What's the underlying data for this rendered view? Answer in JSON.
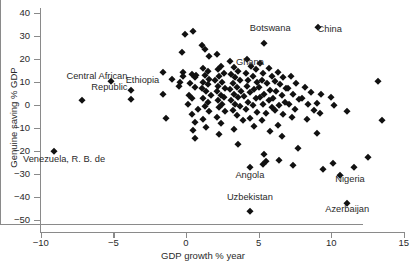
{
  "chart_data": {
    "type": "scatter",
    "title": "",
    "xlabel": "GDP growth % year",
    "ylabel": "Genuine saving % GDP",
    "xlim": [
      -10,
      15
    ],
    "ylim": [
      -50,
      40
    ],
    "xticks": [
      -10,
      -5,
      0,
      5,
      10,
      15
    ],
    "xticklabels": [
      "−10",
      "−5",
      "0",
      "5",
      "10",
      "15"
    ],
    "yticks": [
      40,
      30,
      20,
      10,
      0,
      -10,
      -20,
      -30,
      -40,
      -50
    ],
    "yticklabels": [
      "40",
      "30",
      "20",
      "10",
      "0",
      "−10",
      "−20",
      "−30",
      "−40",
      "−50"
    ],
    "grid": false,
    "legend": null,
    "reference_lines": [
      {
        "axis": "x",
        "value": 0
      },
      {
        "axis": "y",
        "value": 0
      }
    ],
    "marker": "diamond",
    "marker_color": "#111111",
    "annotations": [
      {
        "label": "Central African Republic",
        "x": -7.2,
        "y": 12.0,
        "point_x": -7.2,
        "point_y": 2.0
      },
      {
        "label": "Ethiopia",
        "x": -3.0,
        "y": 10.5,
        "point_x": -3.8,
        "point_y": 6.5
      },
      {
        "label": "Botswana",
        "x": 5.8,
        "y": 33.0,
        "point_x": 5.4,
        "point_y": 27.0
      },
      {
        "label": "Ghana",
        "x": 4.4,
        "y": 18.5,
        "point_x": 4.5,
        "point_y": 17.0
      },
      {
        "label": "China",
        "x": 9.9,
        "y": 32.5,
        "point_x": 9.1,
        "point_y": 34.0
      },
      {
        "label": "Venezuela, R. B. de",
        "x": -8.4,
        "y": -24.0,
        "point_x": -9.1,
        "point_y": -20.0
      },
      {
        "label": "Angola",
        "x": 4.4,
        "y": -31.0,
        "point_x": 4.4,
        "point_y": -27.0
      },
      {
        "label": "Nigeria",
        "x": 11.3,
        "y": -32.5,
        "point_x": 10.6,
        "point_y": -30.5
      },
      {
        "label": "Uzbekistan",
        "x": 4.4,
        "y": -40.5,
        "point_x": 4.4,
        "point_y": -46.0
      },
      {
        "label": "Azerbaijan",
        "x": 11.1,
        "y": -45.5,
        "point_x": 11.1,
        "point_y": -42.5
      }
    ],
    "points": [
      [
        -9.1,
        -20.0
      ],
      [
        -7.2,
        2.0
      ],
      [
        -5.2,
        10.5
      ],
      [
        -3.8,
        6.5
      ],
      [
        -3.8,
        2.5
      ],
      [
        -1.6,
        14.5
      ],
      [
        -1.0,
        11.5
      ],
      [
        -1.6,
        5.0
      ],
      [
        -1.4,
        -5.5
      ],
      [
        -0.3,
        23.0
      ],
      [
        -0.2,
        14.5
      ],
      [
        -0.2,
        12.5
      ],
      [
        -0.4,
        10.0
      ],
      [
        -0.5,
        8.5
      ],
      [
        -0.1,
        31.0
      ],
      [
        0.5,
        32.0
      ],
      [
        0.4,
        13.5
      ],
      [
        0.7,
        13.0
      ],
      [
        0.6,
        12.0
      ],
      [
        0.3,
        9.5
      ],
      [
        0.6,
        8.0
      ],
      [
        0.2,
        4.5
      ],
      [
        0.4,
        3.0
      ],
      [
        0.1,
        0.5
      ],
      [
        0.8,
        -1.5
      ],
      [
        0.4,
        -4.0
      ],
      [
        0.6,
        -7.5
      ],
      [
        0.5,
        -11.0
      ],
      [
        0.6,
        -14.5
      ],
      [
        1.1,
        26.0
      ],
      [
        1.3,
        24.5
      ],
      [
        1.6,
        21.5
      ],
      [
        1.2,
        16.0
      ],
      [
        1.5,
        15.0
      ],
      [
        1.3,
        13.0
      ],
      [
        1.6,
        11.5
      ],
      [
        1.2,
        10.0
      ],
      [
        1.5,
        9.0
      ],
      [
        1.1,
        7.5
      ],
      [
        1.4,
        6.0
      ],
      [
        1.7,
        4.5
      ],
      [
        1.2,
        3.0
      ],
      [
        1.5,
        1.5
      ],
      [
        1.3,
        -0.5
      ],
      [
        1.6,
        -2.5
      ],
      [
        1.2,
        -6.0
      ],
      [
        1.4,
        -9.5
      ],
      [
        2.1,
        22.0
      ],
      [
        2.4,
        17.0
      ],
      [
        2.2,
        15.5
      ],
      [
        2.6,
        14.0
      ],
      [
        2.3,
        12.5
      ],
      [
        2.0,
        11.0
      ],
      [
        2.5,
        10.0
      ],
      [
        2.2,
        8.5
      ],
      [
        2.7,
        7.5
      ],
      [
        2.1,
        6.0
      ],
      [
        2.4,
        4.5
      ],
      [
        2.6,
        3.5
      ],
      [
        2.2,
        2.0
      ],
      [
        2.5,
        0.5
      ],
      [
        2.3,
        -1.0
      ],
      [
        2.7,
        -2.5
      ],
      [
        2.1,
        -5.0
      ],
      [
        2.4,
        -8.0
      ],
      [
        2.3,
        -12.5
      ],
      [
        3.0,
        19.0
      ],
      [
        3.3,
        16.5
      ],
      [
        3.6,
        15.0
      ],
      [
        3.1,
        13.5
      ],
      [
        3.4,
        12.0
      ],
      [
        3.7,
        11.0
      ],
      [
        3.2,
        9.5
      ],
      [
        3.5,
        8.0
      ],
      [
        3.0,
        7.0
      ],
      [
        3.8,
        6.0
      ],
      [
        3.3,
        5.0
      ],
      [
        3.6,
        3.5
      ],
      [
        3.1,
        2.0
      ],
      [
        3.4,
        0.5
      ],
      [
        3.7,
        -0.5
      ],
      [
        3.2,
        -2.0
      ],
      [
        3.5,
        -4.5
      ],
      [
        3.9,
        -6.5
      ],
      [
        3.3,
        -10.5
      ],
      [
        3.6,
        -17.0
      ],
      [
        4.5,
        17.0
      ],
      [
        4.2,
        20.0
      ],
      [
        4.8,
        15.5
      ],
      [
        4.1,
        14.0
      ],
      [
        4.6,
        12.5
      ],
      [
        4.3,
        11.0
      ],
      [
        4.9,
        10.0
      ],
      [
        4.2,
        8.5
      ],
      [
        4.7,
        7.0
      ],
      [
        4.4,
        5.5
      ],
      [
        4.0,
        4.0
      ],
      [
        4.8,
        3.0
      ],
      [
        4.3,
        1.5
      ],
      [
        4.6,
        0.0
      ],
      [
        4.1,
        -1.5
      ],
      [
        4.9,
        -3.0
      ],
      [
        4.4,
        -5.5
      ],
      [
        4.7,
        -9.0
      ],
      [
        4.4,
        -27.0
      ],
      [
        4.4,
        -46.0
      ],
      [
        5.4,
        27.0
      ],
      [
        5.1,
        18.5
      ],
      [
        5.7,
        16.0
      ],
      [
        5.3,
        14.0
      ],
      [
        5.9,
        12.5
      ],
      [
        5.2,
        11.0
      ],
      [
        5.6,
        9.5
      ],
      [
        5.0,
        8.0
      ],
      [
        5.8,
        6.5
      ],
      [
        5.4,
        5.0
      ],
      [
        5.1,
        3.5
      ],
      [
        5.7,
        2.0
      ],
      [
        5.3,
        0.5
      ],
      [
        5.9,
        -1.0
      ],
      [
        5.5,
        -3.5
      ],
      [
        5.2,
        -6.5
      ],
      [
        5.8,
        -11.5
      ],
      [
        5.5,
        -24.5
      ],
      [
        5.3,
        -25.5
      ],
      [
        5.4,
        -21.5
      ],
      [
        6.3,
        14.5
      ],
      [
        6.7,
        12.0
      ],
      [
        6.1,
        10.5
      ],
      [
        6.5,
        9.0
      ],
      [
        6.9,
        7.5
      ],
      [
        6.2,
        6.0
      ],
      [
        6.6,
        4.5
      ],
      [
        6.0,
        3.0
      ],
      [
        6.8,
        1.5
      ],
      [
        6.4,
        0.0
      ],
      [
        6.1,
        -2.0
      ],
      [
        6.7,
        -4.0
      ],
      [
        6.3,
        -8.5
      ],
      [
        6.6,
        -13.5
      ],
      [
        6.4,
        -24.0
      ],
      [
        7.2,
        12.5
      ],
      [
        7.6,
        9.5
      ],
      [
        7.0,
        7.5
      ],
      [
        7.4,
        5.0
      ],
      [
        7.8,
        2.5
      ],
      [
        7.1,
        0.5
      ],
      [
        7.5,
        -1.5
      ],
      [
        7.3,
        -5.0
      ],
      [
        7.7,
        -18.5
      ],
      [
        7.4,
        -26.0
      ],
      [
        8.2,
        8.0
      ],
      [
        8.6,
        5.5
      ],
      [
        8.0,
        3.0
      ],
      [
        8.4,
        0.5
      ],
      [
        8.8,
        -2.0
      ],
      [
        8.3,
        -6.0
      ],
      [
        9.1,
        34.0
      ],
      [
        9.3,
        5.0
      ],
      [
        9.0,
        1.0
      ],
      [
        9.2,
        -3.5
      ],
      [
        9.0,
        -12.0
      ],
      [
        9.4,
        -28.0
      ],
      [
        10.0,
        3.5
      ],
      [
        10.2,
        0.0
      ],
      [
        10.6,
        -30.5
      ],
      [
        10.1,
        -25.0
      ],
      [
        11.1,
        -2.5
      ],
      [
        11.1,
        -42.5
      ],
      [
        11.6,
        -27.0
      ],
      [
        12.5,
        -22.5
      ],
      [
        13.2,
        10.5
      ],
      [
        13.5,
        -6.5
      ]
    ]
  },
  "axis": {
    "x_title": "GDP growth % year",
    "y_title": "Genuine saving % GDP"
  }
}
